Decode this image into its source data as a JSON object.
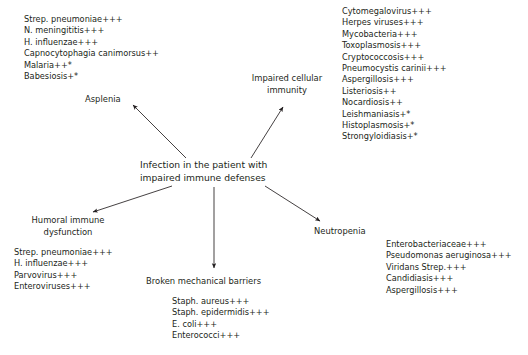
{
  "center": {
    "line1": "Infection in the patient with",
    "line2": "impaired immune defenses"
  },
  "branches": {
    "asplenia": {
      "label": "Asplenia",
      "organisms": [
        "Strep. pneumoniae+++",
        "N. meningititis+++",
        "H. influenzae+++",
        "Capnocytophagia canimorsus++",
        "Malaria++*",
        "Babesiosis+*"
      ]
    },
    "cellular": {
      "label_line1": "Impaired cellular",
      "label_line2": "immunity",
      "organisms": [
        "Cytomegalovirus+++",
        "Herpes viruses+++",
        "Mycobacteria+++",
        "Toxoplasmosis+++",
        "Cryptococcosis+++",
        "Pneumocystis carinii+++",
        "Aspergillosis+++",
        "Listeriosis++",
        "Nocardiosis++",
        "Leishmaniasis+*",
        "Histoplasmosis+*",
        "Strongyloidiasis+*"
      ]
    },
    "humoral": {
      "label_line1": "Humoral immune",
      "label_line2": "dysfunction",
      "organisms": [
        "Strep. pneumoniae+++",
        "H. influenzae+++",
        "Parvovirus+++",
        "Enteroviruses+++"
      ]
    },
    "barriers": {
      "label": "Broken mechanical barriers",
      "organisms": [
        "Staph. aureus+++",
        "Staph. epidermidis+++",
        "E. coli+++",
        "Enterococci+++"
      ]
    },
    "neutropenia": {
      "label": "Neutropenia",
      "organisms": [
        "Enterobacteriaceae+++",
        "Pseudomonas aeruginosa+++",
        "Viridans Strep.+++",
        "Candidiasis+++",
        "Aspergillosis+++"
      ]
    }
  },
  "style": {
    "arrow_color": "#231f20",
    "text_color": "#231f20",
    "background": "#ffffff"
  }
}
